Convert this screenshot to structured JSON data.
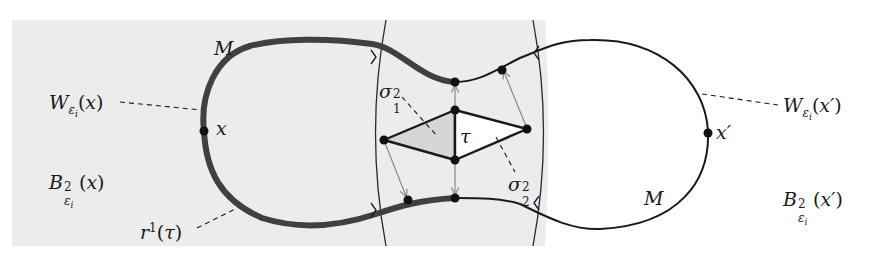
{
  "diagram": {
    "type": "topology-illustration",
    "colors": {
      "shaded_region": "#ececec",
      "thick_curve": "#404040",
      "thin_curve": "#1a1a1a",
      "shaded_triangle": "#d6d6d6",
      "arrow": "#8a8a8a"
    },
    "labels": {
      "manifold_left": "M",
      "manifold_right": "M",
      "point_x": "x",
      "point_x_prime": "x′",
      "wall_left": {
        "base": "W",
        "sub": "ε",
        "subsub": "i",
        "arg": "(x)"
      },
      "wall_right": {
        "base": "W",
        "sub": "ε",
        "subsub": "i",
        "arg": "(x′)"
      },
      "ball_left": {
        "base": "B",
        "sup": "2",
        "sub": "ε",
        "subsub": "i",
        "arg": "(x)"
      },
      "ball_right": {
        "base": "B",
        "sup": "2",
        "sub": "ε",
        "subsub": "i",
        "arg": "(x′)"
      },
      "retraction": {
        "base": "r",
        "sup": "1",
        "arg": "(τ)"
      },
      "tau": "τ",
      "sigma_1": {
        "base": "σ",
        "sup": "2",
        "sub": "1"
      },
      "sigma_2": {
        "base": "σ",
        "sup": "2",
        "sub": "2"
      }
    }
  }
}
